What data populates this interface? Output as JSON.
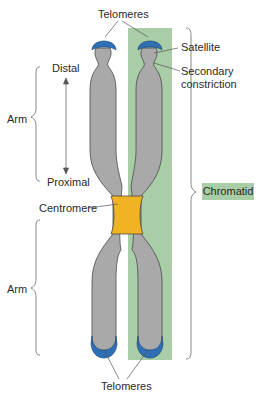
{
  "diagram": {
    "labels": {
      "telomeres_top": "Telomeres",
      "satellite": "Satellite",
      "secondary_constriction_line1": "Secondary",
      "secondary_constriction_line2": "constriction",
      "distal": "Distal",
      "proximal": "Proximal",
      "arm_upper": "Arm",
      "arm_lower": "Arm",
      "centromere": "Centromere",
      "chromatid": "Chromatid",
      "telomeres_bottom": "Telomeres"
    },
    "colors": {
      "chromosome_fill": "#a9a9a9",
      "chromosome_outline": "#4a4a4a",
      "telomere": "#2f6fb6",
      "centromere": "#f0b323",
      "chromatid_highlight": "#a9cda7",
      "leader_lines": "#555555"
    },
    "icons": {
      "distal_proximal_arrow": "double-headed-vertical-arrow",
      "arm_brace": "curly-brace-left",
      "chromatid_brace": "curly-brace-right"
    }
  }
}
